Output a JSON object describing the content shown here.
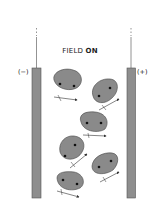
{
  "title": {
    "prefix": "FIELD ",
    "state": "ON"
  },
  "electrodes": {
    "left": {
      "label": "(−)",
      "polarity": "negative"
    },
    "right": {
      "label": "(+)",
      "polarity": "positive"
    }
  },
  "colors": {
    "electrode_fill": "#8e8e8e",
    "electrode_stroke": "#555555",
    "cell_fill": "#8a8a8a",
    "cell_stroke": "#444444",
    "nucleus": "#111111",
    "arrow": "#333333"
  },
  "cells": [
    {
      "id": 1,
      "nuclei": 2
    },
    {
      "id": 2,
      "nuclei": 2
    },
    {
      "id": 3,
      "nuclei": 2
    },
    {
      "id": 4,
      "nuclei": 2
    },
    {
      "id": 5,
      "nuclei": 2
    },
    {
      "id": 6,
      "nuclei": 2
    }
  ]
}
